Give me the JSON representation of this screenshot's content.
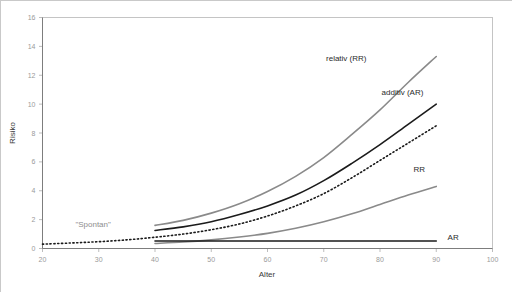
{
  "chart_data": {
    "type": "line",
    "title": "",
    "xlabel": "Alter",
    "ylabel": "Risiko",
    "xlim": [
      20,
      100
    ],
    "ylim": [
      0,
      16
    ],
    "xticks": [
      20,
      30,
      40,
      50,
      60,
      70,
      80,
      90,
      100
    ],
    "yticks": [
      0,
      2,
      4,
      6,
      8,
      10,
      12,
      14,
      16
    ],
    "grid": false,
    "legend": "inline-annotations",
    "annotations": [
      {
        "text": "\"Spontan\"",
        "x": 29,
        "y": 1.5,
        "style": "gray"
      },
      {
        "text": "relativ (RR)",
        "x": 74,
        "y": 13.0,
        "style": "dark"
      },
      {
        "text": "additiv (AR)",
        "x": 84,
        "y": 10.6,
        "style": "dark"
      },
      {
        "text": "RR",
        "x": 87,
        "y": 5.3,
        "style": "dark"
      },
      {
        "text": "AR",
        "x": 93,
        "y": 0.6,
        "style": "dark"
      }
    ],
    "series": [
      {
        "name": "\"Spontan\"",
        "label": "\"Spontan\"",
        "style": "dotted",
        "color": "#1b1b1b",
        "x": [
          20,
          25,
          30,
          35,
          40,
          45,
          50,
          55,
          60,
          65,
          70,
          75,
          80,
          85,
          90
        ],
        "values": [
          0.3,
          0.38,
          0.47,
          0.6,
          0.78,
          1.0,
          1.3,
          1.7,
          2.25,
          2.95,
          3.8,
          4.9,
          6.1,
          7.3,
          8.5
        ]
      },
      {
        "name": "relativ (RR)",
        "label": "relativ (RR)",
        "style": "solid",
        "color": "#8a8a8a",
        "x": [
          40,
          45,
          50,
          55,
          60,
          65,
          70,
          75,
          80,
          85,
          90
        ],
        "values": [
          1.6,
          1.95,
          2.45,
          3.1,
          3.95,
          5.0,
          6.3,
          7.9,
          9.6,
          11.5,
          13.3
        ]
      },
      {
        "name": "additiv (AR)",
        "label": "additiv (AR)",
        "style": "solid",
        "color": "#1b1b1b",
        "x": [
          40,
          45,
          50,
          55,
          60,
          65,
          70,
          75,
          80,
          85,
          90
        ],
        "values": [
          1.25,
          1.5,
          1.85,
          2.35,
          2.95,
          3.7,
          4.7,
          5.9,
          7.2,
          8.6,
          10.0
        ]
      },
      {
        "name": "RR",
        "label": "RR",
        "style": "solid",
        "color": "#8a8a8a",
        "x": [
          40,
          45,
          50,
          55,
          60,
          65,
          70,
          75,
          80,
          85,
          90
        ],
        "values": [
          0.35,
          0.45,
          0.6,
          0.8,
          1.05,
          1.4,
          1.85,
          2.4,
          3.05,
          3.7,
          4.3
        ]
      },
      {
        "name": "AR",
        "label": "AR",
        "style": "solid",
        "color": "#1b1b1b",
        "x": [
          40,
          50,
          60,
          70,
          80,
          90
        ],
        "values": [
          0.52,
          0.52,
          0.52,
          0.52,
          0.52,
          0.52
        ]
      }
    ]
  },
  "axes": {
    "y_title": "Risiko",
    "x_title": "Alter"
  }
}
